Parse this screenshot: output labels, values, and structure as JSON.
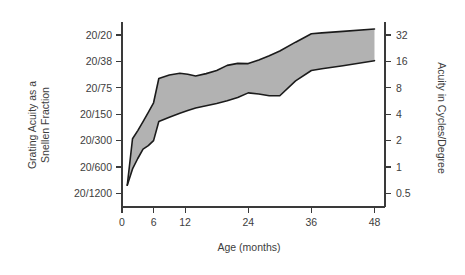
{
  "chart_data": {
    "type": "area",
    "title": "",
    "xlabel": "Age (months)",
    "ylabel": "Grating Acuity as a Snellen Fraction",
    "ylabel_line1": "Grating Acuity as a",
    "ylabel_line2": "Snellen Fraction",
    "y2label": "Acuity in Cycles/Degree",
    "grid": false,
    "legend": "none",
    "xlim": [
      0,
      50
    ],
    "xticks": [
      0,
      6,
      12,
      24,
      36,
      48
    ],
    "xticklabels": [
      "0",
      "6",
      "12",
      "24",
      "36",
      "48"
    ],
    "yscale": "log2",
    "ylim_cpd": [
      0.35,
      45
    ],
    "yticks_cpd": [
      32,
      16,
      8,
      4,
      2,
      1,
      0.5
    ],
    "yticklabels_left": [
      "20/20",
      "20/38",
      "20/75",
      "20/150",
      "20/300",
      "20/600",
      "20/1200"
    ],
    "yticklabels_right": [
      "32",
      "16",
      "8",
      "4",
      "2",
      "1",
      "0.5"
    ],
    "band_color": "#b2b2b2",
    "edge_color": "#1b1b1b",
    "series": [
      {
        "name": "Upper bound (best acuity)",
        "x": [
          1.0,
          2.0,
          3.0,
          4.0,
          5.0,
          6.0,
          7.0,
          9.0,
          11.0,
          12.5,
          14.0,
          16.0,
          18.0,
          20.0,
          22.0,
          24.0,
          26.0,
          28.0,
          30.0,
          33.0,
          36.0,
          38.0,
          42.0,
          48.0
        ],
        "values": [
          0.62,
          2.1,
          2.6,
          3.3,
          4.2,
          5.4,
          10.2,
          11.2,
          11.7,
          11.4,
          10.9,
          11.6,
          12.6,
          14.4,
          15.2,
          15.1,
          16.6,
          18.6,
          21.0,
          26.5,
          33.0,
          33.8,
          35.2,
          37.5
        ]
      },
      {
        "name": "Lower bound (poorest acuity)",
        "x": [
          1.0,
          2.0,
          3.0,
          4.0,
          5.0,
          6.0,
          7.0,
          9.0,
          11.0,
          12.5,
          14.0,
          16.0,
          18.0,
          20.0,
          22.0,
          24.0,
          26.0,
          28.0,
          30.0,
          33.0,
          36.0,
          38.0,
          42.0,
          48.0
        ],
        "values": [
          0.62,
          0.95,
          1.25,
          1.6,
          1.75,
          2.0,
          3.3,
          3.7,
          4.1,
          4.4,
          4.7,
          5.0,
          5.3,
          5.7,
          6.2,
          7.0,
          6.8,
          6.5,
          6.5,
          9.6,
          12.6,
          13.2,
          14.3,
          16.3
        ]
      }
    ]
  },
  "axes": {
    "left_title_line1": "Grating Acuity as a",
    "left_title_line2": "Snellen Fraction",
    "right_title": "Acuity in Cycles/Degree",
    "bottom_title": "Age (months)"
  }
}
